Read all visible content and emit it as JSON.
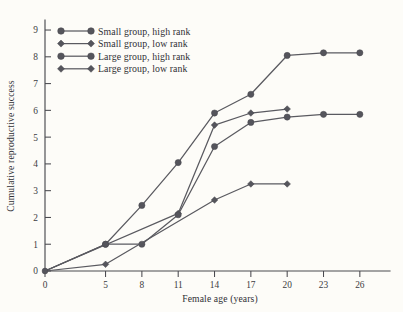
{
  "chart_data": {
    "type": "line",
    "title": "",
    "xlabel": "Female age (years)",
    "ylabel": "Cumulative reproductive success",
    "xlim": [
      0,
      27.5
    ],
    "ylim": [
      0,
      9.3
    ],
    "xticks": [
      0,
      5,
      8,
      11,
      14,
      17,
      20,
      23,
      26
    ],
    "xtick_labels": [
      "0",
      "5",
      "8",
      "11",
      "14",
      "17",
      "20",
      "23",
      "26"
    ],
    "yticks": [
      0,
      1,
      2,
      3,
      4,
      5,
      6,
      7,
      8,
      9
    ],
    "ytick_labels": [
      "0",
      "1",
      "2",
      "3",
      "4",
      "5",
      "6",
      "7",
      "8",
      "9"
    ],
    "grid": false,
    "legend_position": "upper-left",
    "line_color": "#5a5a60",
    "marker_color": "#55555c",
    "background_color": "#fdfcf8",
    "series": [
      {
        "name": "Small group, high rank",
        "marker": "circle",
        "x": [
          0,
          5,
          8,
          11,
          14,
          17,
          20,
          23,
          26
        ],
        "values": [
          0,
          1.0,
          2.45,
          4.05,
          5.9,
          6.6,
          8.05,
          8.15,
          8.15
        ]
      },
      {
        "name": "Small group, low rank",
        "marker": "diamond",
        "x": [
          0,
          11,
          14,
          17,
          20
        ],
        "values": [
          0,
          2.15,
          5.45,
          5.9,
          6.05
        ]
      },
      {
        "name": "Large group, high rank",
        "marker": "circle",
        "x": [
          0,
          5,
          8,
          11,
          14,
          17,
          20,
          23,
          26
        ],
        "values": [
          0,
          1.0,
          1.0,
          2.1,
          4.65,
          5.55,
          5.75,
          5.85,
          5.85
        ]
      },
      {
        "name": "Large group, low rank",
        "marker": "diamond",
        "x": [
          0,
          5,
          14,
          17,
          20
        ],
        "values": [
          0,
          0.25,
          2.65,
          3.25,
          3.25
        ]
      }
    ]
  },
  "legend": {
    "entries": [
      {
        "label": "Small group, high rank",
        "marker": "circle"
      },
      {
        "label": "Small group, low rank",
        "marker": "diamond"
      },
      {
        "label": "Large group, high rank",
        "marker": "circle"
      },
      {
        "label": "Large group, low rank",
        "marker": "diamond"
      }
    ]
  }
}
